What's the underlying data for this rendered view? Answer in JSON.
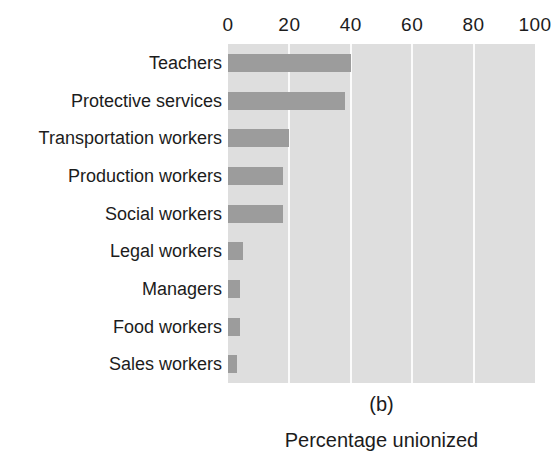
{
  "clipped_top_text": "·  ·  ··   ·   ·  ··",
  "chart_data": {
    "type": "bar",
    "orientation": "horizontal",
    "title": "",
    "panel_caption": "(b)",
    "xlabel": "Percentage unionized",
    "ylabel": "",
    "xlim": [
      0,
      100
    ],
    "xticks": [
      0,
      20,
      40,
      60,
      80,
      100
    ],
    "xtick_labels": [
      "0",
      "20",
      "40",
      "60",
      "80",
      "100"
    ],
    "grid": true,
    "grid_axis": "x",
    "legend": false,
    "plot_background_color": "#dedede",
    "gridline_color": "#fbfbfb",
    "bar_color": "#9c9c9c",
    "categories": [
      "Teachers",
      "Protective services",
      "Transportation workers",
      "Production workers",
      "Social workers",
      "Legal workers",
      "Managers",
      "Food workers",
      "Sales workers"
    ],
    "values": [
      40,
      38,
      20,
      18,
      18,
      5,
      4,
      4,
      3
    ]
  }
}
